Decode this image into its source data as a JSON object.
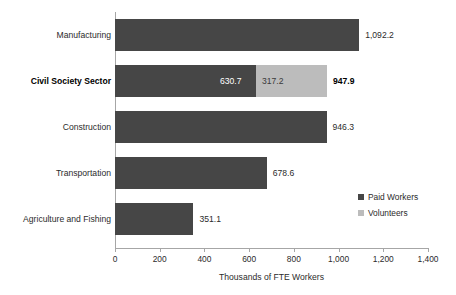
{
  "chart_data": {
    "type": "bar",
    "orientation": "horizontal",
    "stacked": true,
    "title": "",
    "xlabel": "Thousands of FTE Workers",
    "ylabel": "",
    "xlim": [
      0,
      1400
    ],
    "xticks": [
      "0",
      "200",
      "400",
      "600",
      "800",
      "1,000",
      "1,200",
      "1,400"
    ],
    "xtick_values": [
      0,
      200,
      400,
      600,
      800,
      1000,
      1200,
      1400
    ],
    "grid": false,
    "legend_position": "right-inside",
    "categories": [
      "Manufacturing",
      "Civil Society Sector",
      "Construction",
      "Transportation",
      "Agriculture and Fishing"
    ],
    "series": [
      {
        "name": "Paid Workers",
        "color": "#464646",
        "values": [
          1092.2,
          630.7,
          946.3,
          678.6,
          351.1
        ]
      },
      {
        "name": "Volunteers",
        "color": "#bcbcbc",
        "values": [
          0,
          317.2,
          0,
          0,
          0
        ]
      }
    ],
    "totals": [
      1092.2,
      947.9,
      946.3,
      678.6,
      351.1
    ],
    "rows": [
      {
        "category": "Manufacturing",
        "highlight": false,
        "paid": 1092.2,
        "volunteers": 0,
        "total": 1092.2,
        "paid_label": "",
        "volunteers_label": "",
        "total_label": "1,092.2"
      },
      {
        "category": "Civil Society Sector",
        "highlight": true,
        "paid": 630.7,
        "volunteers": 317.2,
        "total": 947.9,
        "paid_label": "630.7",
        "volunteers_label": "317.2",
        "total_label": "947.9"
      },
      {
        "category": "Construction",
        "highlight": false,
        "paid": 946.3,
        "volunteers": 0,
        "total": 946.3,
        "paid_label": "",
        "volunteers_label": "",
        "total_label": "946.3"
      },
      {
        "category": "Transportation",
        "highlight": false,
        "paid": 678.6,
        "volunteers": 0,
        "total": 678.6,
        "paid_label": "",
        "volunteers_label": "",
        "total_label": "678.6"
      },
      {
        "category": "Agriculture and Fishing",
        "highlight": false,
        "paid": 351.1,
        "volunteers": 0,
        "total": 351.1,
        "paid_label": "",
        "volunteers_label": "",
        "total_label": "351.1"
      }
    ]
  },
  "legend": {
    "items": [
      {
        "label": "Paid Workers",
        "color": "#464646"
      },
      {
        "label": "Volunteers",
        "color": "#bcbcbc"
      }
    ]
  },
  "axis": {
    "title": "Thousands of FTE Workers",
    "line_color": "#a6a6a6"
  }
}
